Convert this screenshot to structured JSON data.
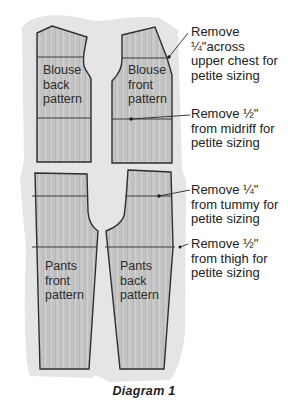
{
  "pieces": {
    "blouse_back": {
      "label": "Blouse\nback\npattern"
    },
    "blouse_front": {
      "label": "Blouse\nfront\npattern"
    },
    "pants_front": {
      "label": "Pants\nfront\npattern"
    },
    "pants_back": {
      "label": "Pants\nback\npattern"
    }
  },
  "annotations": [
    {
      "text": "Remove\n¼\"across\nupper chest for\npetite sizing",
      "target": "upper chest line on blouse front"
    },
    {
      "text": "Remove ½\"\nfrom midriff for\npetite sizing",
      "target": "midriff line on blouse front"
    },
    {
      "text": "Remove ¼\"\nfrom tummy for\npetite sizing",
      "target": "tummy line on pants back"
    },
    {
      "text": "Remove ½\"\nfrom thigh for\npetite sizing",
      "target": "thigh line on pants back"
    }
  ],
  "caption": "Diagram 1",
  "colors": {
    "outline": "#2e2e2e",
    "fill": "#c4c4c4",
    "wash": "#dcdcdc"
  }
}
